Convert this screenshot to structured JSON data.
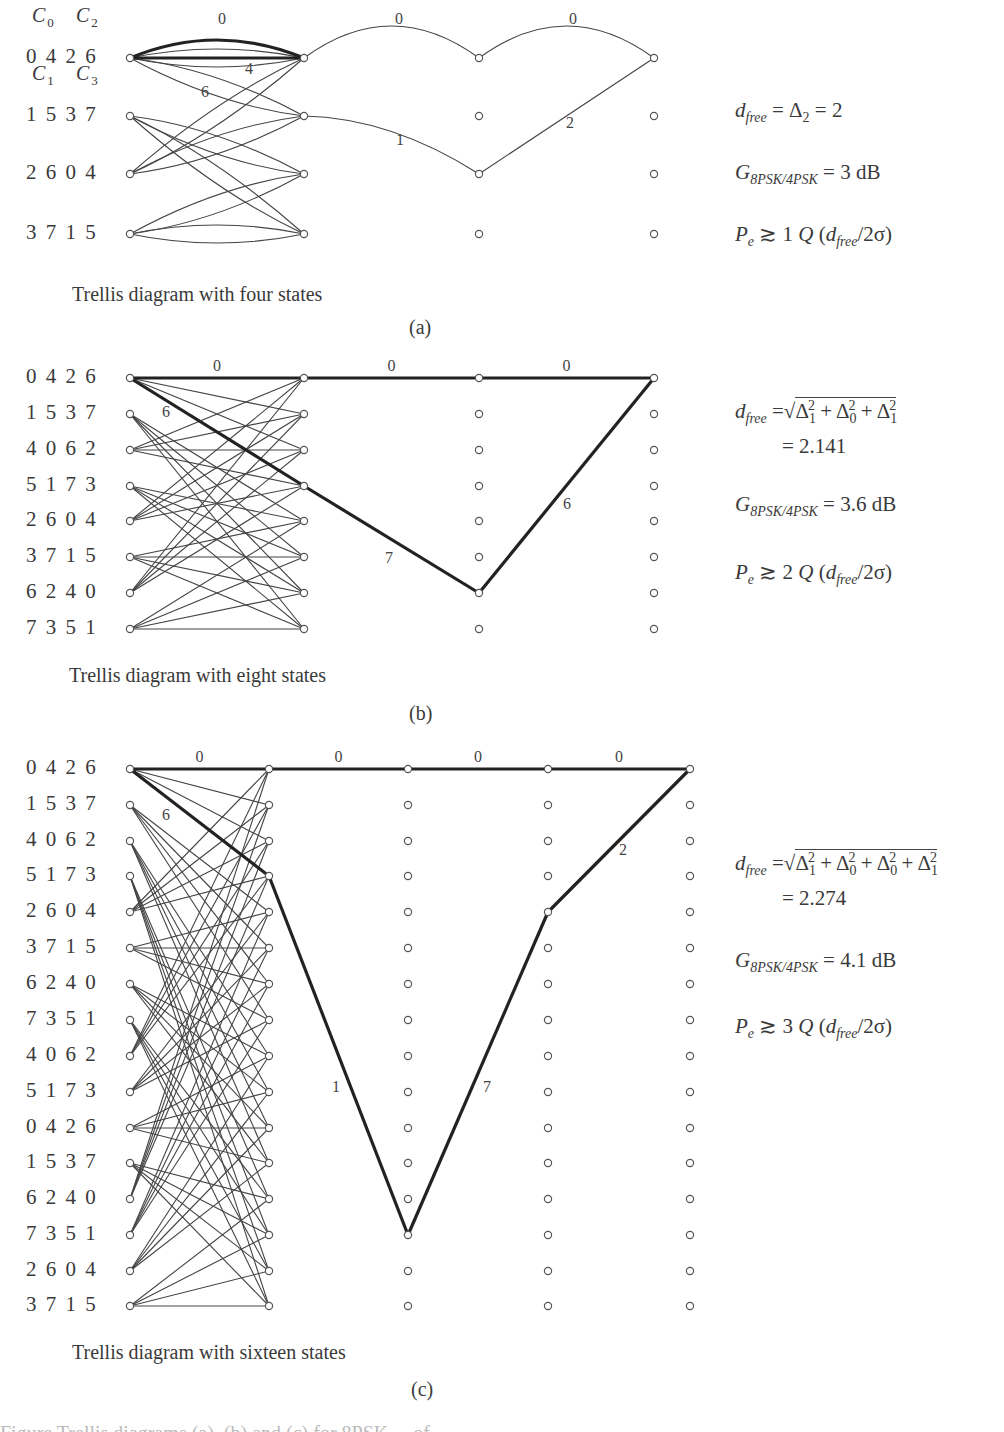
{
  "panels": [
    {
      "id": "a",
      "caption": "Trellis diagram with four states",
      "sublabel": "(a)",
      "cols_x": [
        130,
        304,
        479,
        654
      ],
      "rows_y": [
        58,
        116,
        174,
        234
      ],
      "state_labels": [
        "0 4 2 6",
        "1 5 3 7",
        "2 6 0 4",
        "3 7 1 5"
      ],
      "coset_labels": {
        "top": [
          "C0",
          "C2"
        ],
        "second": [
          "C1",
          "C3"
        ]
      },
      "branches": [
        [
          0,
          1
        ],
        [
          2,
          3
        ],
        [
          0,
          1
        ],
        [
          2,
          3
        ]
      ],
      "parallel": true,
      "error_path": {
        "nodes": [
          [
            0,
            0
          ],
          [
            1,
            1
          ],
          [
            2,
            2
          ],
          [
            3,
            0
          ]
        ],
        "labels": [
          "1",
          "2"
        ],
        "label_pos": [
          [
            400,
            145
          ],
          [
            570,
            128
          ]
        ]
      },
      "zero_path_labels": [
        "0",
        "0",
        "0"
      ],
      "branch_labels": [
        {
          "text": "4",
          "x": 249,
          "y": 74
        },
        {
          "text": "6",
          "x": 205,
          "y": 97
        }
      ],
      "equations": {
        "dfree": "d_free = Δ2 = 2",
        "gain": "G_8PSK/4PSK = 3 dB",
        "pe": "Pe ≳ 1 Q (d_free/2σ)",
        "gain_value": "3 dB",
        "pe_multiplier": "1"
      }
    },
    {
      "id": "b",
      "caption": "Trellis diagram with eight states",
      "sublabel": "(b)",
      "cols_x": [
        130,
        304,
        479,
        654
      ],
      "rows_y": [
        378,
        414,
        450,
        486,
        521,
        557,
        593,
        629
      ],
      "state_labels": [
        "0 4 2 6",
        "1 5 3 7",
        "4 0 6 2",
        "5 1 7 3",
        "2 6 0 4",
        "3 7 1 5",
        "6 2 4 0",
        "7 3 5 1"
      ],
      "error_path": {
        "nodes": [
          [
            0,
            0
          ],
          [
            1,
            3
          ],
          [
            2,
            6
          ],
          [
            3,
            0
          ]
        ],
        "labels": [
          "7",
          "6"
        ],
        "label_pos": [
          [
            389,
            563
          ],
          [
            567,
            509
          ]
        ]
      },
      "zero_path_labels": [
        "0",
        "0",
        "0"
      ],
      "branch_labels": [
        {
          "text": "6",
          "x": 166,
          "y": 417
        }
      ],
      "equations": {
        "dfree": "d_free = √(Δ1² + Δ0² + Δ1²) = 2.141",
        "dfree_value": "= 2.141",
        "gain": "G_8PSK/4PSK = 3.6 dB",
        "gain_value": "3.6 dB",
        "pe": "Pe ≳ 2 Q (d_free/2σ)",
        "pe_multiplier": "2"
      }
    },
    {
      "id": "c",
      "caption": "Trellis diagram with sixteen states",
      "sublabel": "(c)",
      "cols_x": [
        130,
        269,
        408,
        548,
        690
      ],
      "rows_y": [
        769,
        805,
        841,
        876,
        912,
        948,
        984,
        1020,
        1056,
        1092,
        1128,
        1163,
        1199,
        1235,
        1271,
        1306
      ],
      "state_labels": [
        "0 4 2 6",
        "1 5 3 7",
        "4 0 6 2",
        "5 1 7 3",
        "2 6 0 4",
        "3 7 1 5",
        "6 2 4 0",
        "7 3 5 1",
        "4 0 6 2",
        "5 1 7 3",
        "0 4 2 6",
        "1 5 3 7",
        "6 2 4 0",
        "7 3 5 1",
        "2 6 0 4",
        "3 7 1 5"
      ],
      "error_path": {
        "nodes": [
          [
            0,
            0
          ],
          [
            1,
            3
          ],
          [
            2,
            13
          ],
          [
            3,
            4
          ],
          [
            4,
            0
          ]
        ],
        "labels": [
          "1",
          "7",
          "2"
        ],
        "label_pos": [
          [
            336,
            1092
          ],
          [
            487,
            1092
          ],
          [
            623,
            855
          ]
        ]
      },
      "zero_path_labels": [
        "0",
        "0",
        "0",
        "0"
      ],
      "branch_labels": [
        {
          "text": "6",
          "x": 166,
          "y": 820
        }
      ],
      "equations": {
        "dfree": "d_free = √(Δ1² + Δ0² + Δ0² + Δ1²) = 2.274",
        "dfree_value": "= 2.274",
        "gain": "G_8PSK/4PSK = 4.1 dB",
        "gain_value": "4.1 dB",
        "pe": "Pe ≳ 3 Q (d_free/2σ)",
        "pe_multiplier": "3"
      }
    }
  ],
  "text": {
    "a_caption": "Trellis diagram with four states",
    "a_sub": "(a)",
    "b_caption": "Trellis diagram with eight states",
    "b_sub": "(b)",
    "c_caption": "Trellis diagram with sixteen states",
    "c_sub": "(c)",
    "a_states": [
      "0 4 2 6",
      "1 5 3 7",
      "2 6 0 4",
      "3 7 1 5"
    ],
    "c0": "C",
    "c0_sub": "0",
    "c1": "C",
    "c1_sub": "1",
    "c2": "C",
    "c2_sub": "2",
    "c3": "C",
    "c3_sub": "3",
    "eq_a_pe_mult": "1",
    "eq_b_pe_mult": "2",
    "eq_c_pe_mult": "3",
    "eq_a_gain": "3 dB",
    "eq_b_gain": "3.6 dB",
    "eq_c_gain": "4.1 dB",
    "eq_b_value": "= 2.141",
    "eq_c_value": "= 2.274",
    "truncated_footer": "Figure  Trellis diagrams (a), (b) and (c) for 8PSK ... of ..."
  }
}
